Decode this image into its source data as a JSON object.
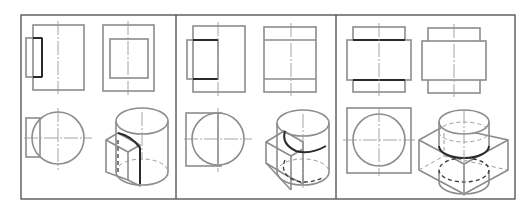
{
  "figure": {
    "colors": {
      "frame": "#4a4a4a",
      "visible_line": "#8c8c8c",
      "emphasis_line": "#2a2a2a",
      "center_line": "#9a9a9a"
    },
    "panels": [
      {
        "id": 1,
        "label": "",
        "views": [
          "front-view",
          "side-view",
          "top-view",
          "isometric-view"
        ],
        "variant": "prism-attached-left"
      },
      {
        "id": 2,
        "label": "",
        "views": [
          "front-view",
          "side-view",
          "top-view",
          "isometric-view"
        ],
        "variant": "prism-half-penetrating"
      },
      {
        "id": 3,
        "label": "",
        "views": [
          "front-view",
          "side-view",
          "top-view",
          "isometric-view"
        ],
        "variant": "prism-fully-penetrating"
      }
    ]
  }
}
